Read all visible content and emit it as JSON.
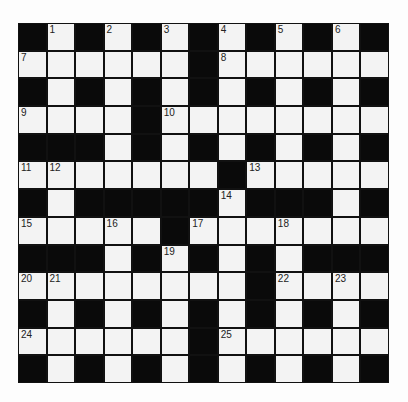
{
  "puzzle": {
    "rows": 13,
    "cols": 13,
    "colors": {
      "block": "#0a0a0a",
      "cell": "#f3f3f3",
      "line": "#111111",
      "background": "#fdfdfd"
    },
    "grid": [
      "#.#.#.#.#.#.#",
      "......#......",
      "#.#.#.#.#.#.#",
      "....#........",
      "###.#.#.#.#.#",
      ".......#.....",
      "#.#####.###.#",
      ".....#.......",
      "###.#.#.#.###",
      "........#....",
      "#.#.#.#.#.#.#",
      "......#......",
      "#.#.#.#.#.#.#"
    ],
    "numbers": [
      {
        "row": 0,
        "col": 1,
        "n": "1"
      },
      {
        "row": 0,
        "col": 3,
        "n": "2"
      },
      {
        "row": 0,
        "col": 5,
        "n": "3"
      },
      {
        "row": 0,
        "col": 7,
        "n": "4"
      },
      {
        "row": 0,
        "col": 9,
        "n": "5"
      },
      {
        "row": 0,
        "col": 11,
        "n": "6"
      },
      {
        "row": 1,
        "col": 0,
        "n": "7"
      },
      {
        "row": 1,
        "col": 7,
        "n": "8"
      },
      {
        "row": 3,
        "col": 0,
        "n": "9"
      },
      {
        "row": 3,
        "col": 5,
        "n": "10"
      },
      {
        "row": 5,
        "col": 0,
        "n": "11"
      },
      {
        "row": 5,
        "col": 1,
        "n": "12"
      },
      {
        "row": 5,
        "col": 8,
        "n": "13"
      },
      {
        "row": 6,
        "col": 7,
        "n": "14"
      },
      {
        "row": 7,
        "col": 0,
        "n": "15"
      },
      {
        "row": 7,
        "col": 3,
        "n": "16"
      },
      {
        "row": 7,
        "col": 6,
        "n": "17"
      },
      {
        "row": 7,
        "col": 9,
        "n": "18"
      },
      {
        "row": 8,
        "col": 5,
        "n": "19"
      },
      {
        "row": 9,
        "col": 0,
        "n": "20"
      },
      {
        "row": 9,
        "col": 1,
        "n": "21"
      },
      {
        "row": 9,
        "col": 9,
        "n": "22"
      },
      {
        "row": 9,
        "col": 11,
        "n": "23"
      },
      {
        "row": 11,
        "col": 0,
        "n": "24"
      },
      {
        "row": 11,
        "col": 7,
        "n": "25"
      }
    ]
  }
}
